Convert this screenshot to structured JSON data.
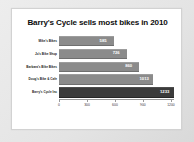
{
  "chart_data": {
    "type": "bar",
    "orientation": "horizontal",
    "title": "Barry's Cycle sells most bikes in 2010",
    "xlabel": "",
    "ylabel": "",
    "categories": [
      "Mike's Bikes",
      "Jo's Bike Shop",
      "Barbara's Bike Bikes",
      "Doug's Bike & Cafe",
      "Barry's Cycle Inc"
    ],
    "values": [
      585,
      726,
      860,
      1013,
      1233
    ],
    "data_labels": [
      "585",
      "726",
      "860",
      "1013",
      "1233"
    ],
    "highlight_index": 4,
    "xlim": [
      0,
      1233
    ],
    "xticks": [
      0,
      300,
      600,
      900,
      1200
    ],
    "xtick_labels": [
      "0",
      "300",
      "600",
      "900",
      "1200"
    ],
    "grid": false,
    "legend": false,
    "bar_color": "#8b8b8b",
    "highlight_color": "#3b3b3b",
    "label_color": "#ffffff",
    "plot_background": "#ffffff",
    "page_background": "#e8e8e8"
  }
}
